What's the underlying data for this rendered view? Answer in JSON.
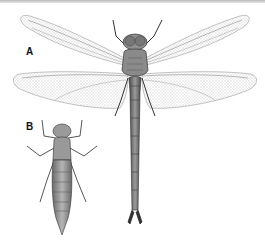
{
  "figure": {
    "labels": {
      "adult": "A",
      "nymph": "B"
    },
    "subjects": [
      {
        "id": "A",
        "description": "adult dragonfly, dorsal view, wings spread"
      },
      {
        "id": "B",
        "description": "dragonfly nymph (larva), dorsal view"
      }
    ],
    "colors": {
      "ink": "#2a2a2a",
      "wing_vein": "#9a9a9a",
      "body_fill": "#8a8a8a",
      "background": "#ffffff"
    }
  }
}
